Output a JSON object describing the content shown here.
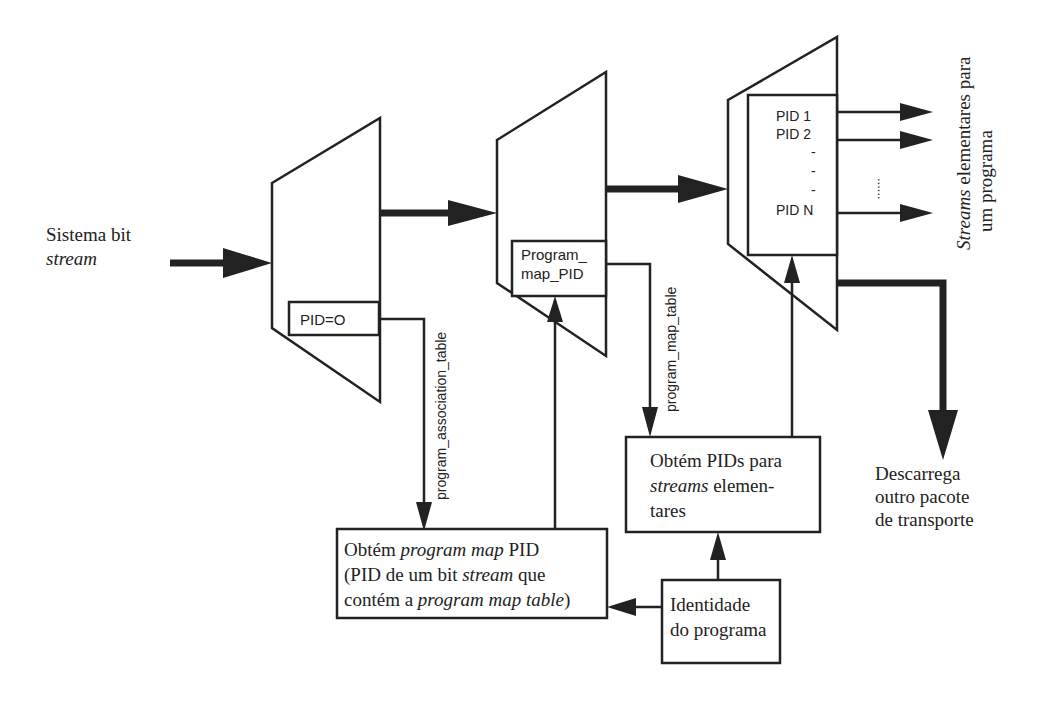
{
  "input_label": {
    "line1": "Sistema bit",
    "line2": "stream"
  },
  "demux1": {
    "box_label": "PID=O"
  },
  "demux2": {
    "box_label_line1": "Program_",
    "box_label_line2": "map_PID"
  },
  "demux3": {
    "pids": [
      "PID 1",
      "PID 2",
      "-",
      "-",
      "-",
      "PID N"
    ],
    "ellipsis": "......"
  },
  "connectors": {
    "pat_label": "program_association_table",
    "pmt_label": "program_map_table"
  },
  "output_label": {
    "line1": "Streams elementares para",
    "line1_italic": "Streams",
    "line1_rest": " elementares para",
    "line2": "um programa"
  },
  "discard_label": {
    "line1": "Descarrega",
    "line2": "outro pacote",
    "line3": "de transporte"
  },
  "box_get_pmt": {
    "line1_a": "Obtém ",
    "line1_b": "program map",
    "line1_c": " PID",
    "line2_a": "(PID de um bit ",
    "line2_b": "stream",
    "line2_c": "  que",
    "line3_a": "contém a ",
    "line3_b": "program map table",
    "line3_c": ")"
  },
  "box_get_pids": {
    "line1": "Obtém PIDs para",
    "line2_a": "streams",
    "line2_b": " elemen-",
    "line3": "tares"
  },
  "box_program_id": {
    "line1": "Identidade",
    "line2": "do programa"
  }
}
